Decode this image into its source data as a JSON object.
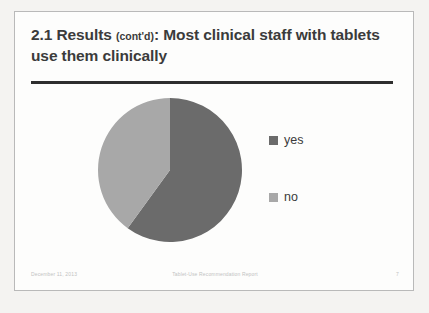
{
  "slide": {
    "title_main_1": "2.1 Results ",
    "title_contd": "(cont'd)",
    "title_main_2": ": Most clinical staff with tablets use them clinically",
    "background": "#fdfdfc",
    "border_color": "#b9b9b9",
    "rule_color": "#2e2e2e",
    "title_color": "#3b3b3b"
  },
  "footer": {
    "date": "December 11, 2013",
    "center": "Tablet-Use Recommendation Report",
    "page": "7",
    "color": "#c2c2c2"
  },
  "chart_data": {
    "type": "pie",
    "title": "",
    "categories": [
      "yes",
      "no"
    ],
    "values": [
      60,
      40
    ],
    "colors": [
      "#6b6b6b",
      "#a8a8a8"
    ],
    "start_angle_deg": 0,
    "direction": "clockwise",
    "legend_position": "right",
    "grid": false,
    "labels_shown": false
  },
  "legend": {
    "items": [
      {
        "label": "yes",
        "color": "#6b6b6b"
      },
      {
        "label": "no",
        "color": "#a8a8a8"
      }
    ]
  }
}
